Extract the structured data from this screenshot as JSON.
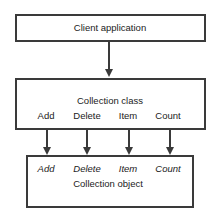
{
  "diagram": {
    "client_box": {
      "label": "Client application"
    },
    "class_box": {
      "label": "Collection class",
      "methods": [
        "Add",
        "Delete",
        "Item",
        "Count"
      ]
    },
    "object_box": {
      "label": "Collection object",
      "methods": [
        "Add",
        "Delete",
        "Item",
        "Count"
      ]
    },
    "colors": {
      "line": "#3a3a3a",
      "text": "#222222",
      "background": "#ffffff"
    }
  }
}
